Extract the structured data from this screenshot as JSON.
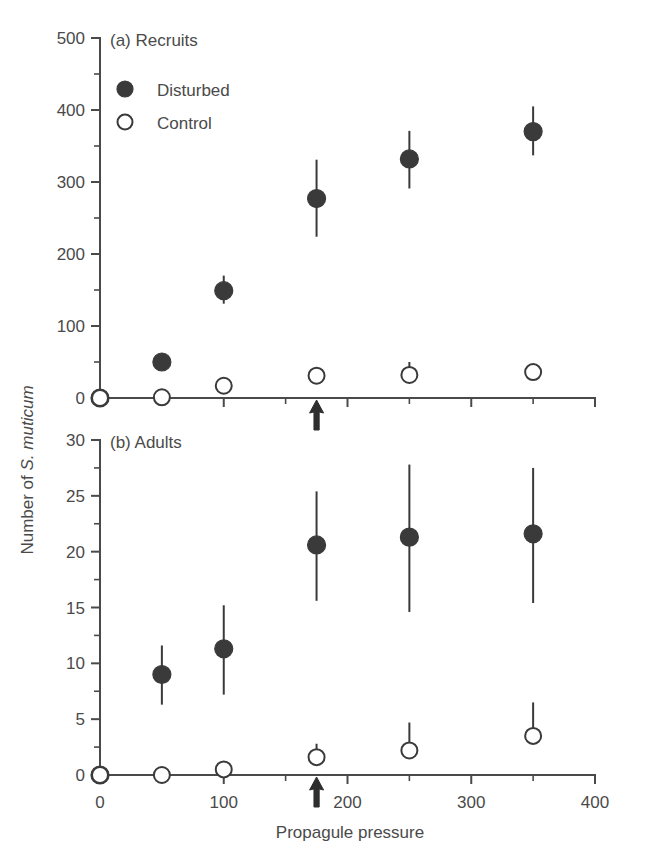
{
  "figure": {
    "axis_y_title_prefix": "Number of ",
    "axis_y_title_italic": "S. muticum",
    "axis_x_title": "Propagule pressure",
    "marker_filled_color": "#3a3a3a",
    "marker_open_color": "#ffffff",
    "axis_color": "#4a4a4a",
    "background": "#ffffff"
  },
  "legend": {
    "items": [
      {
        "label": "Disturbed",
        "marker": "filled-circle-icon"
      },
      {
        "label": "Control",
        "marker": "open-circle-icon"
      }
    ]
  },
  "annotations": {
    "arrow_label": "up-arrow-marker",
    "arrow_x_value": 175
  },
  "chart_data": [
    {
      "type": "scatter",
      "panel": "a",
      "title": "(a) Recruits",
      "xlabel": "Propagule pressure",
      "ylabel": "Number of S. muticum",
      "xlim": [
        0,
        400
      ],
      "ylim": [
        0,
        500
      ],
      "xticks": [
        0,
        100,
        200,
        300,
        400
      ],
      "xtick_labels": [
        "0",
        "100",
        "200",
        "300",
        "400"
      ],
      "xticks_minor": [
        50,
        150,
        250,
        350
      ],
      "yticks": [
        0,
        100,
        200,
        300,
        400,
        500
      ],
      "ytick_labels": [
        "0",
        "100",
        "200",
        "300",
        "400",
        "500"
      ],
      "yticks_minor": [
        50,
        150,
        250,
        350,
        450
      ],
      "grid": false,
      "legend_position": "top-left-inside",
      "x": [
        0,
        50,
        100,
        175,
        250,
        350
      ],
      "series": [
        {
          "name": "Disturbed",
          "marker": "filled-circle-icon",
          "values": [
            0,
            50,
            149,
            277,
            332,
            370
          ],
          "err_low": [
            0,
            40,
            131,
            224,
            291,
            337
          ],
          "err_high": [
            0,
            62,
            170,
            331,
            371,
            405
          ]
        },
        {
          "name": "Control",
          "marker": "open-circle-icon",
          "values": [
            0,
            1,
            17,
            31,
            32,
            36
          ],
          "err_low": [
            0,
            1,
            17,
            25,
            25,
            31
          ],
          "err_high": [
            0,
            1,
            17,
            38,
            50,
            41
          ]
        }
      ]
    },
    {
      "type": "scatter",
      "panel": "b",
      "title": "(b) Adults",
      "xlabel": "Propagule pressure",
      "ylabel": "Number of S. muticum",
      "xlim": [
        0,
        400
      ],
      "ylim": [
        0,
        30
      ],
      "xticks": [
        0,
        100,
        200,
        300,
        400
      ],
      "xtick_labels": [
        "0",
        "100",
        "200",
        "300",
        "400"
      ],
      "xticks_minor": [
        50,
        150,
        250,
        350
      ],
      "yticks": [
        0,
        5,
        10,
        15,
        20,
        25,
        30
      ],
      "ytick_labels": [
        "0",
        "5",
        "10",
        "15",
        "20",
        "25",
        "30"
      ],
      "yticks_minor": [
        2.5,
        7.5,
        12.5,
        17.5,
        22.5,
        27.5
      ],
      "grid": false,
      "legend_position": "none",
      "x": [
        0,
        50,
        100,
        175,
        250,
        350
      ],
      "series": [
        {
          "name": "Disturbed",
          "marker": "filled-circle-icon",
          "values": [
            0,
            9.0,
            11.3,
            20.6,
            21.3,
            21.6
          ],
          "err_low": [
            0,
            6.3,
            7.2,
            15.6,
            14.6,
            15.4
          ],
          "err_high": [
            0,
            11.6,
            15.2,
            25.4,
            27.8,
            27.5
          ]
        },
        {
          "name": "Control",
          "marker": "open-circle-icon",
          "values": [
            0,
            0,
            0.5,
            1.6,
            2.2,
            3.5
          ],
          "err_low": [
            0,
            0,
            0.5,
            1.6,
            2.2,
            3.5
          ],
          "err_high": [
            0,
            0,
            0.5,
            2.8,
            4.7,
            6.5
          ]
        }
      ]
    }
  ]
}
